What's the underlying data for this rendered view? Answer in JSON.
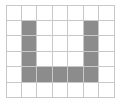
{
  "diagram": {
    "type": "grid-shape",
    "cols": 7,
    "rows": 6,
    "cell_size": 15.5,
    "grid_line_color": "#c8c8c8",
    "fill_color": "#8c8c8c",
    "background": "#ffffff",
    "shaded_cells": [
      [
        1,
        1
      ],
      [
        1,
        2
      ],
      [
        1,
        3
      ],
      [
        1,
        4
      ],
      [
        2,
        4
      ],
      [
        3,
        4
      ],
      [
        4,
        4
      ],
      [
        5,
        1
      ],
      [
        5,
        2
      ],
      [
        5,
        3
      ],
      [
        5,
        4
      ]
    ]
  }
}
